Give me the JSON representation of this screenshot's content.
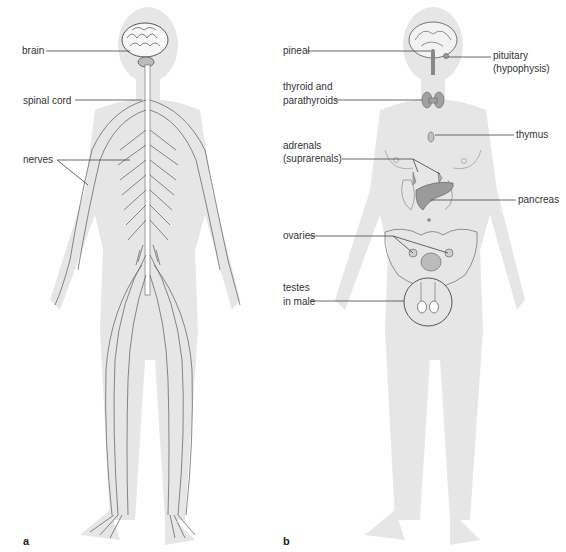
{
  "figure": {
    "panels": [
      {
        "id": "a",
        "letter": "a",
        "subject": "nervous system",
        "labels": {
          "brain": "brain",
          "spinal_cord": "spinal cord",
          "nerves": "nerves"
        }
      },
      {
        "id": "b",
        "letter": "b",
        "subject": "endocrine system",
        "labels": {
          "pineal": "pineal",
          "pituitary_1": "pituitary",
          "pituitary_2": "(hypophysis)",
          "thyroid_1": "thyroid and",
          "thyroid_2": "parathyroids",
          "thymus": "thymus",
          "adrenals_1": "adrenals",
          "adrenals_2": "(suprarenals)",
          "pancreas": "pancreas",
          "ovaries": "ovaries",
          "testes_1": "testes",
          "testes_2": "in male"
        }
      }
    ]
  },
  "colors": {
    "silhouette": "#e6e6e6",
    "nerve": "#6a6a6a",
    "label_text": "#333333",
    "leader_line": "#444444",
    "organ": "#9a9a9a"
  }
}
